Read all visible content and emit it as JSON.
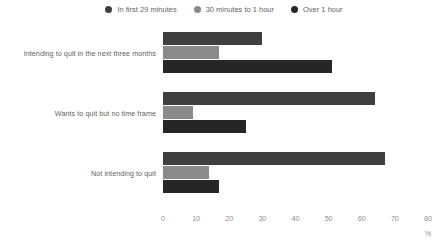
{
  "chart_data": {
    "type": "bar",
    "orientation": "horizontal",
    "title": "",
    "subtitle": "",
    "xlabel": "%",
    "ylabel": "",
    "xlim": [
      0,
      80
    ],
    "xticks": [
      "0",
      "10",
      "20",
      "30",
      "40",
      "50",
      "60",
      "70",
      "80"
    ],
    "xtick_values": [
      0,
      10,
      20,
      30,
      40,
      50,
      60,
      70,
      80
    ],
    "grid": false,
    "legend_position": "top-center",
    "categories": [
      "Intending to quit in the next three months",
      "Wants to quit but no time frame",
      "Not intending to quit"
    ],
    "series": [
      {
        "name": "In first 29 minutes",
        "color": "#3f3f3f",
        "values": [
          30,
          64,
          67
        ]
      },
      {
        "name": "30 minutes to 1 hour",
        "color": "#8a8a8a",
        "values": [
          17,
          9,
          14
        ]
      },
      {
        "name": "Over 1 hour",
        "color": "#262626",
        "values": [
          51,
          25,
          17
        ]
      }
    ]
  },
  "legend": {
    "items": [
      {
        "label": "In first 29 minutes",
        "color": "#3f3f3f",
        "icon": "circle-swatch-icon"
      },
      {
        "label": "30 minutes to 1 hour",
        "color": "#8a8a8a",
        "icon": "circle-swatch-icon"
      },
      {
        "label": "Over 1 hour",
        "color": "#262626",
        "icon": "circle-swatch-icon"
      }
    ]
  },
  "axis": {
    "unit": "%",
    "ticks": [
      "0",
      "10",
      "20",
      "30",
      "40",
      "50",
      "60",
      "70",
      "80"
    ]
  }
}
